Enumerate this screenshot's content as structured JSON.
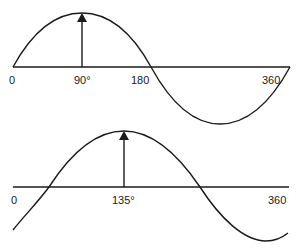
{
  "diagram": {
    "top_wave": {
      "phasor_label": "90°",
      "axis_labels": {
        "start": "0",
        "mid": "180",
        "end": "360"
      },
      "peak_at_degrees": 90
    },
    "bottom_wave": {
      "phasor_label": "135°",
      "axis_labels": {
        "start": "0",
        "end": "360"
      },
      "peak_at_degrees": 135
    },
    "colors": {
      "line": "#1a1a1a",
      "background": "#ffffff"
    }
  }
}
